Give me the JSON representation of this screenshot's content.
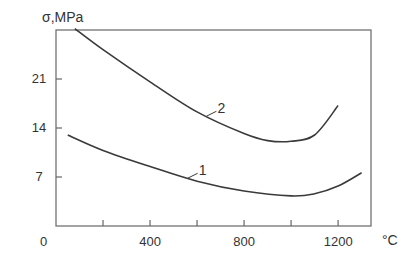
{
  "chart_data": {
    "type": "line",
    "title": "",
    "ylabel": "σ,MPa",
    "xlabel": "°C",
    "xlim": [
      0,
      1340
    ],
    "ylim": [
      0,
      28
    ],
    "x_ticks": [
      0,
      200,
      400,
      600,
      800,
      1000,
      1200
    ],
    "x_tick_labels": [
      "0",
      "400",
      "800",
      "1200"
    ],
    "y_ticks": [
      0,
      7,
      14,
      21
    ],
    "y_tick_labels": [
      "0",
      "7",
      "14",
      "21"
    ],
    "grid": false,
    "legend": "inline numeric labels on curves",
    "series": [
      {
        "name": "1",
        "x": [
          50,
          200,
          400,
          600,
          800,
          1000,
          1100,
          1200,
          1300
        ],
        "y": [
          13.0,
          10.8,
          8.5,
          6.4,
          5.0,
          4.3,
          4.6,
          5.7,
          7.6
        ]
      },
      {
        "name": "2",
        "x": [
          80,
          200,
          400,
          600,
          800,
          900,
          1000,
          1100,
          1200
        ],
        "y": [
          28.2,
          25.2,
          20.6,
          16.3,
          13.2,
          12.2,
          12.1,
          13.0,
          17.2
        ]
      }
    ]
  }
}
